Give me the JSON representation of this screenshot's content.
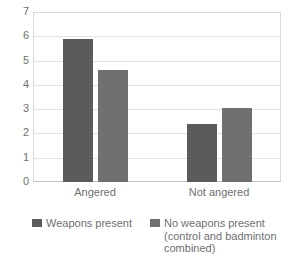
{
  "chart_data": {
    "type": "bar",
    "title": "",
    "xlabel": "",
    "ylabel": "",
    "categories": [
      "Angered",
      "Not angered"
    ],
    "series": [
      {
        "name": "Weapons present",
        "color": "#5b5b5d",
        "values": [
          5.9,
          2.4
        ]
      },
      {
        "name": "No weapons present (control and badminton combined)",
        "color": "#6f7072",
        "values": [
          4.6,
          3.05
        ]
      }
    ],
    "ylim": [
      0,
      7
    ],
    "yticks": [
      0,
      1,
      2,
      3,
      4,
      5,
      6,
      7
    ],
    "ytick_labels": [
      "0",
      "1",
      "2",
      "3",
      "4",
      "5",
      "6",
      "7"
    ],
    "grid": true,
    "legend_position": "bottom"
  },
  "legend": {
    "entries": [
      {
        "label": "Weapons present"
      },
      {
        "label": "No weapons present\n(control and badminton\ncombined)"
      }
    ]
  }
}
